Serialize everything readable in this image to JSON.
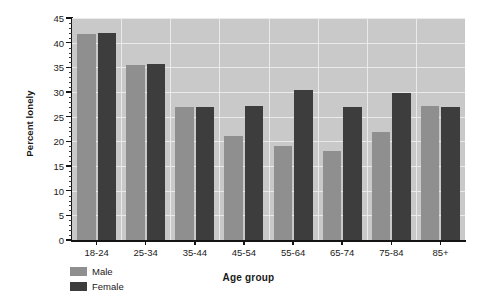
{
  "chart_data": {
    "type": "bar",
    "title": "",
    "xlabel": "Age group",
    "ylabel": "Percent lonely",
    "categories": [
      "18-24",
      "25-34",
      "35-44",
      "45-54",
      "55-64",
      "65-74",
      "75-84",
      "85+"
    ],
    "series": [
      {
        "name": "Male",
        "color": "#8f8f8f",
        "values": [
          41.8,
          35.5,
          27.0,
          21.0,
          19.0,
          18.0,
          21.8,
          27.2
        ]
      },
      {
        "name": "Female",
        "color": "#3d3d3d",
        "values": [
          42.0,
          35.7,
          27.0,
          27.2,
          30.5,
          27.0,
          29.8,
          27.0
        ]
      }
    ],
    "ylim": [
      0,
      45
    ],
    "ytick_labels": [
      "0",
      "5",
      "10",
      "15",
      "20",
      "25",
      "30",
      "35",
      "40",
      "45"
    ],
    "ytick_values": [
      0,
      5,
      10,
      15,
      20,
      25,
      30,
      35,
      40,
      45
    ],
    "yminor_step": 1,
    "grid": true,
    "legend_position": "below-left",
    "plot_background": "#c9c9c9",
    "gridline_color": "#eaeaea",
    "axis_color": "#141414"
  }
}
